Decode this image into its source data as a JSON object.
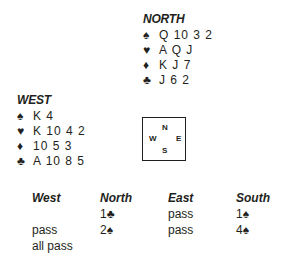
{
  "north": {
    "title": "NORTH",
    "suits": [
      {
        "icon": "spade-icon",
        "symbol": "♠",
        "cards": "Q 10 3 2"
      },
      {
        "icon": "heart-icon",
        "symbol": "♥",
        "cards": "A Q J"
      },
      {
        "icon": "diamond-icon",
        "symbol": "♦",
        "cards": "K J 7"
      },
      {
        "icon": "club-icon",
        "symbol": "♣",
        "cards": "J 6 2"
      }
    ]
  },
  "west": {
    "title": "WEST",
    "suits": [
      {
        "icon": "spade-icon",
        "symbol": "♠",
        "cards": "K 4"
      },
      {
        "icon": "heart-icon",
        "symbol": "♥",
        "cards": "K 10 4 2"
      },
      {
        "icon": "diamond-icon",
        "symbol": "♦",
        "cards": "10 5 3"
      },
      {
        "icon": "club-icon",
        "symbol": "♣",
        "cards": "A 10 8 5"
      }
    ]
  },
  "compass": {
    "n": "N",
    "s": "S",
    "w": "W",
    "e": "E"
  },
  "auction": {
    "headers": [
      "West",
      "North",
      "East",
      "South"
    ],
    "rows": [
      [
        "",
        "1♣",
        "pass",
        "1♠"
      ],
      [
        "pass",
        "2♠",
        "pass",
        "4♠"
      ],
      [
        "all pass",
        "",
        "",
        ""
      ]
    ]
  }
}
